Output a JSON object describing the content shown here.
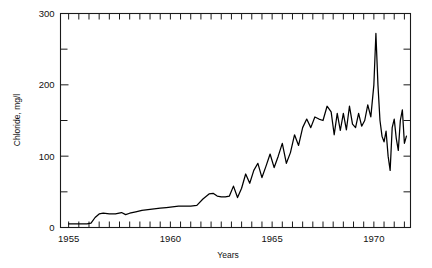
{
  "chart_data": {
    "type": "line",
    "title": "",
    "xlabel": "Years",
    "ylabel": "Chloride, mg/l",
    "xlim": [
      1954.6,
      1971.8
    ],
    "ylim": [
      0,
      300
    ],
    "grid": false,
    "legend": null,
    "yticks": [
      0,
      100,
      200,
      300
    ],
    "ytick_labels": [
      "0",
      "100",
      "200",
      "300"
    ],
    "yminor_ticks": [
      50,
      150,
      250
    ],
    "xticks": [
      1955,
      1960,
      1965,
      1970
    ],
    "xtick_labels": [
      "1955",
      "1960",
      "1965",
      "1970"
    ],
    "xminor_tick_interval": 0.5,
    "series": [
      {
        "name": "Chloride concentration",
        "color": "#000000",
        "x": [
          1955.0,
          1955.3,
          1955.6,
          1955.9,
          1956.1,
          1956.3,
          1956.5,
          1956.7,
          1957.0,
          1957.3,
          1957.6,
          1957.8,
          1958.0,
          1958.3,
          1958.6,
          1958.9,
          1959.2,
          1959.5,
          1959.8,
          1960.1,
          1960.4,
          1960.7,
          1961.0,
          1961.3,
          1961.6,
          1961.9,
          1962.1,
          1962.3,
          1962.5,
          1962.7,
          1962.9,
          1963.1,
          1963.3,
          1963.5,
          1963.7,
          1963.9,
          1964.1,
          1964.3,
          1964.5,
          1964.7,
          1964.9,
          1965.1,
          1965.3,
          1965.5,
          1965.7,
          1965.9,
          1966.1,
          1966.3,
          1966.5,
          1966.7,
          1966.9,
          1967.1,
          1967.3,
          1967.5,
          1967.7,
          1967.9,
          1968.05,
          1968.2,
          1968.35,
          1968.5,
          1968.65,
          1968.8,
          1968.95,
          1969.1,
          1969.25,
          1969.4,
          1969.55,
          1969.7,
          1969.85,
          1970.0,
          1970.1,
          1970.2,
          1970.3,
          1970.4,
          1970.5,
          1970.6,
          1970.7,
          1970.8,
          1970.9,
          1971.0,
          1971.1,
          1971.2,
          1971.3,
          1971.4,
          1971.5,
          1971.6
        ],
        "y": [
          5,
          5,
          5,
          5,
          6,
          14,
          19,
          20,
          19,
          19,
          21,
          18,
          20,
          22,
          24,
          25,
          26,
          27,
          28,
          29,
          30,
          30,
          30,
          31,
          40,
          47,
          48,
          44,
          43,
          43,
          44,
          58,
          42,
          55,
          75,
          62,
          80,
          90,
          70,
          86,
          103,
          84,
          100,
          118,
          90,
          105,
          130,
          115,
          140,
          152,
          140,
          155,
          152,
          150,
          170,
          162,
          130,
          160,
          136,
          160,
          137,
          170,
          145,
          140,
          160,
          142,
          150,
          172,
          155,
          200,
          272,
          200,
          150,
          128,
          120,
          135,
          100,
          80,
          140,
          152,
          125,
          108,
          150,
          165,
          118,
          128
        ]
      }
    ],
    "annotations": []
  },
  "figure": {
    "background": "#ffffff",
    "axis_color": "#1a1a1a",
    "line_color": "#000000"
  }
}
